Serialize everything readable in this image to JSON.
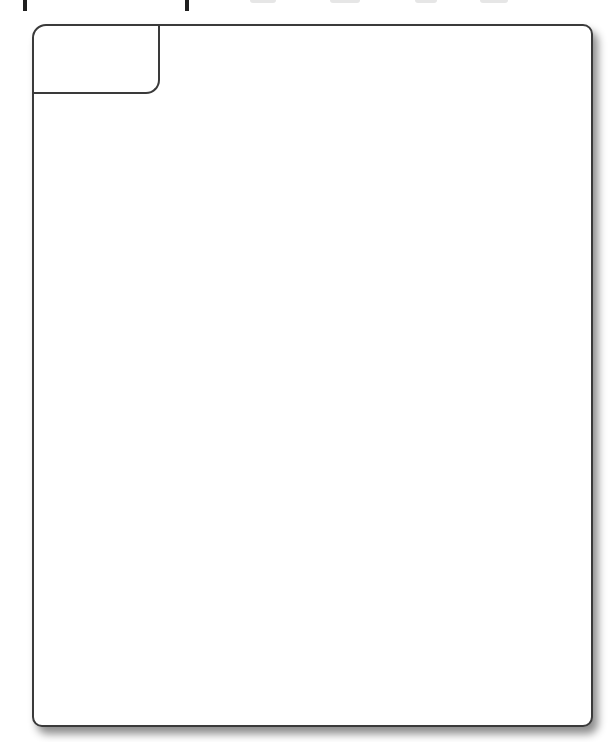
{
  "heading": {
    "text": "",
    "clipped": true,
    "visible_descenders_x": [
      23,
      186
    ]
  },
  "card": {
    "tab_label": "",
    "content_text": "",
    "border_color": "#3a3a3a",
    "background_color": "#ffffff",
    "shadow": "drop shadow bottom-right"
  }
}
